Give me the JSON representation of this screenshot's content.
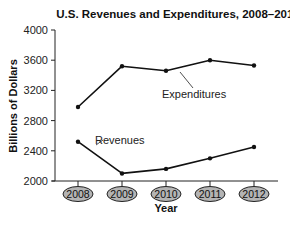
{
  "chart_data": {
    "type": "line",
    "title": "U.S. Revenues and Expenditures, 2008–2012",
    "xlabel": "Year",
    "ylabel": "Billions of Dollars",
    "categories": [
      "2008",
      "2009",
      "2010",
      "2011",
      "2012"
    ],
    "yticks": [
      "2000",
      "2400",
      "2800",
      "3200",
      "3600",
      "4000"
    ],
    "ylim": [
      2000,
      4000
    ],
    "grid": false,
    "legend": "inline labels",
    "series": [
      {
        "name": "Expenditures",
        "values": [
          2980,
          3520,
          3460,
          3600,
          3530
        ]
      },
      {
        "name": "Revenues",
        "values": [
          2520,
          2100,
          2160,
          2300,
          2450
        ]
      }
    ]
  },
  "colors": {
    "line": "#111111",
    "year_badge_fill": "#b4b4b4",
    "year_badge_stroke": "#222222"
  }
}
